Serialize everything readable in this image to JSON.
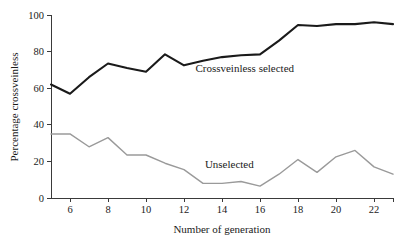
{
  "chart_data": {
    "type": "line",
    "title": "",
    "subtitle": "",
    "xlabel": "Number of generation",
    "ylabel": "Percentage crossveinless",
    "xlim": [
      5,
      23
    ],
    "ylim": [
      0,
      100
    ],
    "grid": false,
    "legend_position": "inline-annotations",
    "xticks": [
      6,
      8,
      10,
      12,
      14,
      16,
      18,
      20,
      22
    ],
    "xtick_labels": [
      "6",
      "8",
      "10",
      "12",
      "14",
      "16",
      "18",
      "20",
      "22"
    ],
    "yticks": [
      0,
      20,
      40,
      60,
      80,
      100
    ],
    "ytick_labels": [
      "0",
      "20",
      "40",
      "60",
      "80",
      "100"
    ],
    "x": [
      5,
      6,
      7,
      8,
      9,
      10,
      11,
      12,
      13,
      14,
      15,
      16,
      17,
      18,
      19,
      20,
      21,
      22,
      23
    ],
    "series": [
      {
        "name": "Crossveinless selected",
        "color": "#1a1a1a",
        "width": 2.1,
        "values": [
          62,
          57,
          66,
          73.5,
          71,
          69,
          78.5,
          72.5,
          75,
          77,
          78,
          78.5,
          86,
          94.5,
          94,
          95,
          95,
          96,
          95
        ]
      },
      {
        "name": "Unselected",
        "color": "#9a9a9a",
        "width": 1.4,
        "values": [
          35,
          35,
          28,
          33,
          23.5,
          23.5,
          19,
          15.5,
          8,
          8,
          9,
          6.5,
          13,
          21,
          14,
          22.5,
          26,
          17,
          13
        ]
      }
    ],
    "annotations": [
      {
        "text": "Crossveinless selected",
        "x": 12.6,
        "y": 69,
        "series": "Crossveinless selected"
      },
      {
        "text": "Unselected",
        "x": 13.1,
        "y": 16.5,
        "series": "Unselected"
      }
    ]
  }
}
